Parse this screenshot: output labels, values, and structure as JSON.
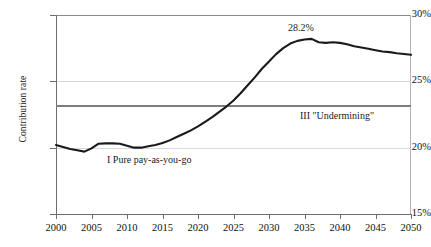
{
  "chart_data": {
    "type": "line",
    "title": "",
    "xlabel": "",
    "ylabel": "Contribution rate",
    "xlim": [
      2000,
      2050
    ],
    "ylim": [
      15,
      30
    ],
    "grid": true,
    "legend_position": "none",
    "y_tick_labels": [
      "30%",
      "25%",
      "20%",
      "15%"
    ],
    "y_tick_values": [
      30,
      25,
      20,
      15
    ],
    "x_tick_labels": [
      "2000",
      "2005",
      "2010",
      "2015",
      "2020",
      "2025",
      "2030",
      "2035",
      "2040",
      "2045",
      "2050"
    ],
    "x_tick_values": [
      2000,
      2005,
      2010,
      2015,
      2020,
      2025,
      2030,
      2035,
      2040,
      2045,
      2050
    ],
    "series": [
      {
        "name": "I Pure pay-as-you-go",
        "color": "#1a1a1a",
        "x": [
          2000,
          2001,
          2002,
          2003,
          2004,
          2005,
          2006,
          2007,
          2008,
          2009,
          2010,
          2011,
          2012,
          2013,
          2014,
          2015,
          2016,
          2017,
          2018,
          2019,
          2020,
          2021,
          2022,
          2023,
          2024,
          2025,
          2026,
          2027,
          2028,
          2029,
          2030,
          2031,
          2032,
          2033,
          2034,
          2035,
          2036,
          2037,
          2038,
          2039,
          2040,
          2041,
          2042,
          2043,
          2044,
          2045,
          2046,
          2047,
          2048,
          2049,
          2050
        ],
        "y": [
          20.2,
          20.05,
          19.9,
          19.8,
          19.7,
          19.95,
          20.3,
          20.32,
          20.32,
          20.3,
          20.15,
          20.0,
          20.0,
          20.1,
          20.2,
          20.35,
          20.55,
          20.8,
          21.05,
          21.3,
          21.6,
          21.95,
          22.3,
          22.7,
          23.1,
          23.55,
          24.1,
          24.7,
          25.3,
          25.95,
          26.5,
          27.05,
          27.5,
          27.85,
          28.05,
          28.15,
          28.2,
          27.95,
          27.9,
          27.95,
          27.9,
          27.8,
          27.65,
          27.55,
          27.45,
          27.35,
          27.25,
          27.2,
          27.12,
          27.06,
          27.0
        ]
      }
    ],
    "reference_lines": [
      {
        "name": "III \"Undermining\"",
        "orientation": "horizontal",
        "value": 23.2,
        "color": "#7d7d7d"
      }
    ],
    "annotations": [
      {
        "name": "peak-value-label",
        "text": "28.2%",
        "x": 2036,
        "y": 28.2
      },
      {
        "name": "series-1-label",
        "text": "I Pure pay-as-you-go",
        "x": 2009,
        "y": 18.6
      },
      {
        "name": "series-3-label",
        "text": "III \"Undermining\"",
        "x": 2035,
        "y": 22.6
      }
    ]
  }
}
